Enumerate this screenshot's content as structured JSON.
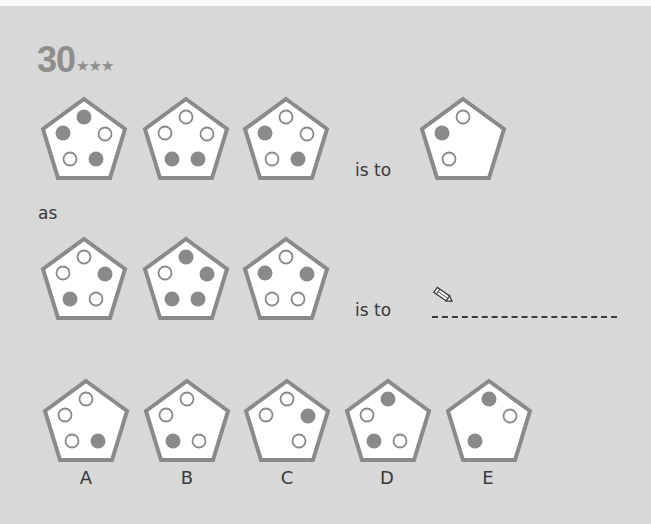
{
  "puzzle": {
    "number": "30",
    "difficulty_stars": "★★★",
    "connector_is_to": "is to",
    "connector_as": "as",
    "pencil_icon": "pencil-icon"
  },
  "colors": {
    "background": "#d8d8d8",
    "pentagon_fill": "#ffffff",
    "pentagon_stroke": "#8a8a8a",
    "dot_filled": "#8a8a8a",
    "dot_empty_stroke": "#8a8a8a",
    "text": "#3a3a3a",
    "number_text": "#8e8e8e"
  },
  "row1": {
    "shapes": [
      {
        "top": "filled",
        "left": "filled",
        "right": "empty",
        "bottom_left": "empty",
        "bottom_right": "filled"
      },
      {
        "top": "empty",
        "left": "empty",
        "right": "empty",
        "bottom_left": "filled",
        "bottom_right": "filled"
      },
      {
        "top": "empty",
        "left": "filled",
        "right": "empty",
        "bottom_left": "empty",
        "bottom_right": "filled"
      }
    ],
    "result": {
      "top": "empty",
      "left": "filled",
      "bottom_left": "empty"
    }
  },
  "row2": {
    "shapes": [
      {
        "top": "empty",
        "left": "empty",
        "right": "filled",
        "bottom_left": "filled",
        "bottom_right": "empty"
      },
      {
        "top": "filled",
        "left": "empty",
        "right": "filled",
        "bottom_left": "filled",
        "bottom_right": "filled"
      },
      {
        "top": "empty",
        "left": "filled",
        "right": "filled",
        "bottom_left": "empty",
        "bottom_right": "empty"
      }
    ],
    "result": "blank answer line"
  },
  "options": [
    {
      "label": "A",
      "dots": {
        "top": "empty",
        "left": "empty",
        "bottom_left": "empty",
        "bottom_right": "filled"
      }
    },
    {
      "label": "B",
      "dots": {
        "top": "empty",
        "left": "empty",
        "bottom_left": "filled",
        "bottom_right": "empty"
      }
    },
    {
      "label": "C",
      "dots": {
        "top": "empty",
        "left": "empty",
        "right": "filled",
        "bottom_right": "empty"
      }
    },
    {
      "label": "D",
      "dots": {
        "top": "filled",
        "left": "empty",
        "bottom_left": "filled",
        "bottom_right": "empty"
      }
    },
    {
      "label": "E",
      "dots": {
        "top": "filled",
        "right": "empty",
        "bottom_left": "filled"
      }
    }
  ]
}
